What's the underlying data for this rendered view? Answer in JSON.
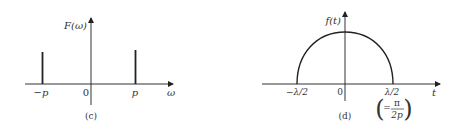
{
  "figures": [
    {
      "id": "c",
      "caption": "(c)",
      "y_label": "F(ω)",
      "x_label": "ω",
      "ticks": [
        {
          "label": "−p",
          "pos": "-p"
        },
        {
          "label": "0",
          "pos": "0"
        },
        {
          "label": "p",
          "pos": "p"
        }
      ],
      "description": "Two impulses (spectral lines) of equal height at ω = −p and ω = p"
    },
    {
      "id": "d",
      "caption": "(d)",
      "y_label": "f(t)",
      "x_label": "t",
      "ticks": [
        {
          "label": "−λ/2",
          "pos": "-lambda/2"
        },
        {
          "label": "0",
          "pos": "0"
        },
        {
          "label": "λ/2",
          "pos": "lambda/2"
        }
      ],
      "annotation": {
        "prefix": "=",
        "numerator": "π",
        "denominator": "2p"
      },
      "description": "Semicircular-arch shaped function f(t) spanning from −λ/2 to λ/2"
    }
  ],
  "colors": {
    "ink": "#222222",
    "background": "#ffffff"
  }
}
